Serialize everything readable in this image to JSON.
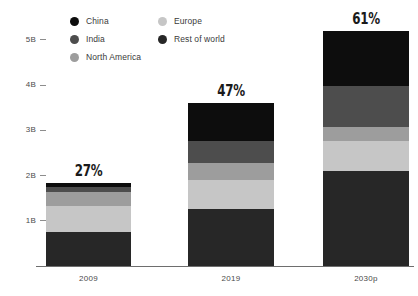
{
  "chart_data": {
    "type": "bar",
    "subtype": "stacked-bar",
    "title": "",
    "subtitle": "",
    "xlabel": "",
    "ylabel": "",
    "categories": [
      "2009",
      "2019",
      "2030p"
    ],
    "ylim": [
      0,
      5.4
    ],
    "yticks": [
      1,
      2,
      3,
      4,
      5
    ],
    "ytick_labels": [
      "1B",
      "2B",
      "3B",
      "4B",
      "5B"
    ],
    "grid": false,
    "legend_position": "top",
    "stack_order_bottom_to_top": [
      "Rest of world",
      "Europe",
      "North America",
      "India",
      "China"
    ],
    "series": [
      {
        "name": "China",
        "color": "#0d0d0d",
        "values": [
          0.09,
          0.84,
          1.22
        ]
      },
      {
        "name": "India",
        "color": "#4d4d4d",
        "values": [
          0.11,
          0.49,
          0.91
        ]
      },
      {
        "name": "North America",
        "color": "#9d9d9d",
        "values": [
          0.31,
          0.38,
          0.31
        ]
      },
      {
        "name": "Europe",
        "color": "#c6c6c6",
        "values": [
          0.57,
          0.64,
          0.66
        ]
      },
      {
        "name": "Rest of world",
        "color": "#272727",
        "values": [
          0.75,
          1.26,
          2.1
        ]
      }
    ],
    "bar_totals": [
      1.83,
      3.61,
      5.2
    ],
    "annotations": [
      {
        "category": "2009",
        "text": "27%"
      },
      {
        "category": "2019",
        "text": "47%"
      },
      {
        "category": "2030p",
        "text": "61%"
      }
    ]
  },
  "legend": {
    "column_1": [
      {
        "label": "China",
        "color": "#0d0d0d",
        "icon": "legend-dot-icon"
      },
      {
        "label": "India",
        "color": "#4d4d4d",
        "icon": "legend-dot-icon"
      },
      {
        "label": "North America",
        "color": "#9d9d9d",
        "icon": "legend-dot-icon"
      }
    ],
    "column_2": [
      {
        "label": "Europe",
        "color": "#c6c6c6",
        "icon": "legend-dot-icon"
      },
      {
        "label": "Rest of world",
        "color": "#272727",
        "icon": "legend-dot-icon"
      }
    ]
  },
  "yaxis": {
    "ticks": [
      {
        "label": "5B",
        "value": 5
      },
      {
        "label": "4B",
        "value": 4
      },
      {
        "label": "3B",
        "value": 3
      },
      {
        "label": "2B",
        "value": 2
      },
      {
        "label": "1B",
        "value": 1
      }
    ]
  },
  "bars": [
    {
      "category": "2009",
      "percent_label": "27%",
      "segments": [
        {
          "name": "China",
          "value": 0.09,
          "color": "#0d0d0d"
        },
        {
          "name": "India",
          "value": 0.11,
          "color": "#4d4d4d"
        },
        {
          "name": "North America",
          "value": 0.31,
          "color": "#9d9d9d"
        },
        {
          "name": "Europe",
          "value": 0.57,
          "color": "#c6c6c6"
        },
        {
          "name": "Rest of world",
          "value": 0.75,
          "color": "#272727"
        }
      ]
    },
    {
      "category": "2019",
      "percent_label": "47%",
      "segments": [
        {
          "name": "China",
          "value": 0.84,
          "color": "#0d0d0d"
        },
        {
          "name": "India",
          "value": 0.49,
          "color": "#4d4d4d"
        },
        {
          "name": "North America",
          "value": 0.38,
          "color": "#9d9d9d"
        },
        {
          "name": "Europe",
          "value": 0.64,
          "color": "#c6c6c6"
        },
        {
          "name": "Rest of world",
          "value": 1.26,
          "color": "#272727"
        }
      ]
    },
    {
      "category": "2030p",
      "percent_label": "61%",
      "segments": [
        {
          "name": "China",
          "value": 1.22,
          "color": "#0d0d0d"
        },
        {
          "name": "India",
          "value": 0.91,
          "color": "#4d4d4d"
        },
        {
          "name": "North America",
          "value": 0.31,
          "color": "#9d9d9d"
        },
        {
          "name": "Europe",
          "value": 0.66,
          "color": "#c6c6c6"
        },
        {
          "name": "Rest of world",
          "value": 2.1,
          "color": "#272727"
        }
      ]
    }
  ],
  "colors": {
    "axis": "#6e6e6e",
    "tick": "#8d8d8d",
    "text": "#3a3a3a",
    "background": "#ffffff"
  }
}
